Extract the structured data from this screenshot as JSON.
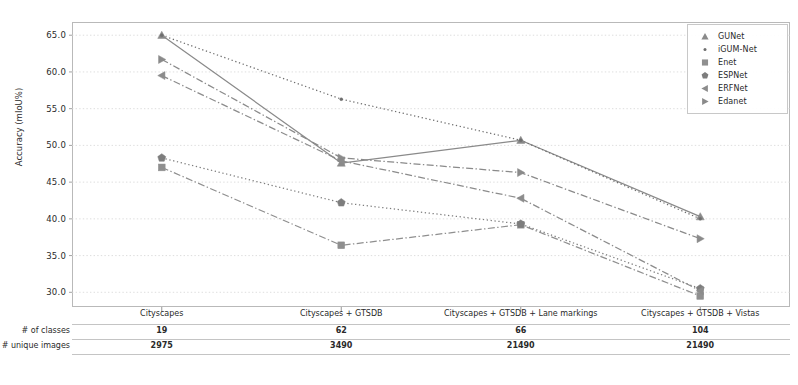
{
  "chart_data": {
    "type": "line",
    "title": "",
    "xlabel": "",
    "ylabel": "Accuracy (mIoU%)",
    "ylim": [
      28.0,
      66.8
    ],
    "yticks": [
      30.0,
      35.0,
      40.0,
      45.0,
      50.0,
      55.0,
      60.0,
      65.0
    ],
    "ytick_labels": [
      "30.0",
      "35.0",
      "40.0",
      "45.0",
      "50.0",
      "55.0",
      "60.0",
      "65.0"
    ],
    "grid": true,
    "legend_position": "upper right",
    "categories": [
      "Cityscapes",
      "Cityscapes + GTSDB",
      "Cityscapes + GTSDB + Lane markings",
      "Cityscapes + GTSDB + Vistas"
    ],
    "series": [
      {
        "name": "GUNet",
        "marker": "triangle-up",
        "linestyle": "solid",
        "color": "#8a8a8a",
        "values": [
          65.0,
          47.6,
          50.7,
          40.3
        ]
      },
      {
        "name": "iGUM-Net",
        "marker": "dot",
        "linestyle": "dotted",
        "color": "#6e6e6e",
        "values": [
          65.0,
          56.3,
          50.7,
          40.0
        ]
      },
      {
        "name": "Enet",
        "marker": "square",
        "linestyle": "dashdot",
        "color": "#8f8f8f",
        "values": [
          47.0,
          36.4,
          39.2,
          29.5
        ]
      },
      {
        "name": "ESPNet",
        "marker": "pentagon",
        "linestyle": "dotted",
        "color": "#7d7d7d",
        "values": [
          48.3,
          42.2,
          39.3,
          30.5
        ]
      },
      {
        "name": "ERFNet",
        "marker": "triangle-left",
        "linestyle": "dashdot",
        "color": "#8c8c8c",
        "values": [
          59.5,
          47.9,
          42.8,
          30.2
        ]
      },
      {
        "name": "Edanet",
        "marker": "triangle-right",
        "linestyle": "dashdot",
        "color": "#8a8a8a",
        "values": [
          61.7,
          48.3,
          46.3,
          37.3
        ]
      }
    ]
  },
  "legend": {
    "entries": [
      {
        "label": "GUNet"
      },
      {
        "label": "iGUM-Net"
      },
      {
        "label": "Enet"
      },
      {
        "label": "ESPNet"
      },
      {
        "label": "ERFNet"
      },
      {
        "label": "Edanet"
      }
    ]
  },
  "table": {
    "headers": [
      "Cityscapes",
      "Cityscapes + GTSDB",
      "Cityscapes + GTSDB + Lane markings",
      "Cityscapes + GTSDB + Vistas"
    ],
    "rows": [
      {
        "label": "# of classes",
        "values": [
          "19",
          "62",
          "66",
          "104"
        ]
      },
      {
        "label": "# unique images",
        "values": [
          "2975",
          "3490",
          "21490",
          "21490"
        ]
      }
    ]
  }
}
